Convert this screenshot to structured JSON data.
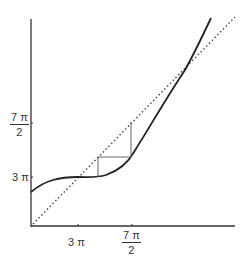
{
  "diagram": {
    "type": "cobweb-plot",
    "x_ticks": [
      {
        "label": "3π",
        "num": "",
        "den": ""
      },
      {
        "label": "7π/2",
        "num": "7 π",
        "den": "2"
      }
    ],
    "y_ticks": [
      {
        "label": "3π"
      },
      {
        "label": "7π/2",
        "num": "7 π",
        "den": "2"
      }
    ],
    "labels": {
      "x_tick_1": "3 π",
      "x_tick_2_num": "7 π",
      "x_tick_2_den": "2",
      "y_tick_1": "3 π",
      "y_tick_2_num": "7 π",
      "y_tick_2_den": "2"
    },
    "series": [
      {
        "name": "curve",
        "style": "solid"
      },
      {
        "name": "y = x",
        "style": "dotted"
      },
      {
        "name": "cobweb",
        "style": "solid-thin"
      }
    ],
    "colors": {
      "axis": "#333333",
      "curve": "#222222",
      "diagonal": "#444444",
      "cobweb": "#666666"
    }
  }
}
